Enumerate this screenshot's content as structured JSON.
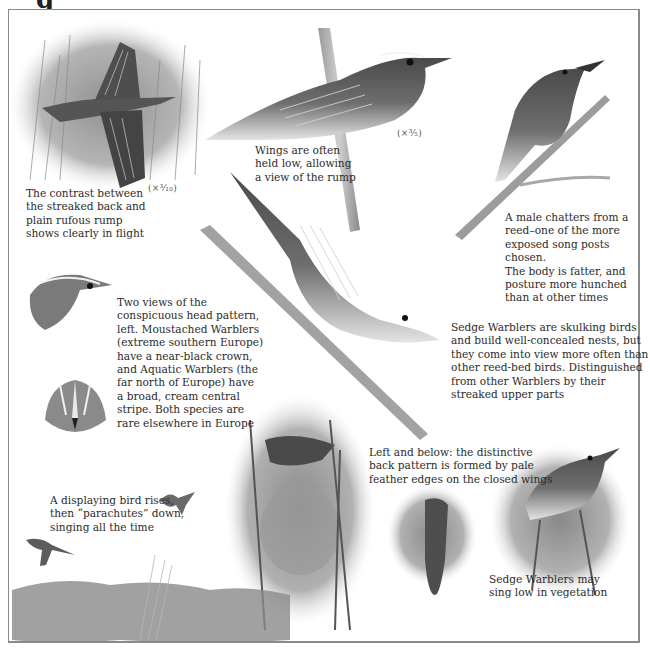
{
  "page": {
    "title_fragment": "g"
  },
  "scales": {
    "flight": "(×³⁄₁₀)",
    "perched": "(×³⁄₅)"
  },
  "captions": {
    "flight": "The contrast between\nthe streaked back and\nplain rufous rump\nshows clearly in flight",
    "wings_low": "Wings are often\nheld low, allowing\na view of the rump",
    "male_chatters": "A male chatters from a\nreed–one of the more\nexposed song posts chosen.\nThe body is fatter, and\nposture more hunched\nthan at other times",
    "head_pattern": "Two views of the\nconspicuous head pattern,\nleft. Moustached Warblers\n(extreme southern Europe)\nhave a near-black crown,\nand Aquatic Warblers (the\nfar north of Europe) have\na broad, cream central\nstripe. Both species are\nrare elsewhere in Europe",
    "skulking": "Sedge Warblers are skulking birds\nand build well-concealed nests, but\nthey come into view more often than\nother reed-bed birds. Distinguished\nfrom other Warblers by their\nstreaked upper parts",
    "back_pattern": "Left and below: the distinctive\nback pattern is formed by pale\nfeather edges on the closed wings",
    "display_flight": "A displaying bird rises,\nthen “parachutes” down,\nsinging all the time",
    "sing_low": "Sedge Warblers may\nsing low in vegetation"
  },
  "illustrations": [
    "flying-warbler-in-reeds",
    "perched-warbler-large",
    "singing-male-on-reed",
    "warbler-descending-reed",
    "head-side-view",
    "head-front-view",
    "warbler-at-nest",
    "warbler-back-view",
    "warbler-singing-in-vegetation",
    "parachuting-bird",
    "flying-bird-small",
    "reed-bed-ground"
  ]
}
